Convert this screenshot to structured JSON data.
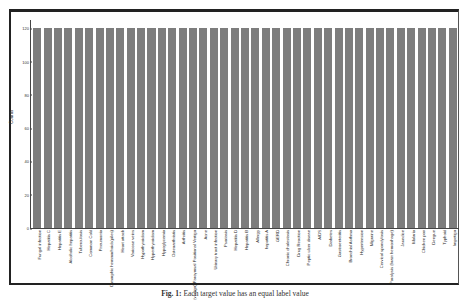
{
  "chart_data": {
    "type": "bar",
    "title": "",
    "xlabel": "",
    "ylabel": "Counts",
    "ylim": [
      0,
      125
    ],
    "yticks": [
      0,
      20,
      40,
      60,
      80,
      100,
      120
    ],
    "grid": false,
    "legend": null,
    "bar_color": "#7d7d7d",
    "categories": [
      "Fungal infection",
      "Hepatitis C",
      "Hepatitis E",
      "Alcoholic hepatitis",
      "Tuberculosis",
      "Common Cold",
      "Pneumonia",
      "Dimorphic hemmorhoids(piles)",
      "Heart attack",
      "Varicose veins",
      "Hypothyroidism",
      "Hyperthyroidism",
      "Hypoglycemia",
      "Osteoarthristis",
      "Arthritis",
      "(vertigo) Paroymsal Positional Vertigo",
      "Acne",
      "Urinary tract infection",
      "Psoriasis",
      "Hepatitis D",
      "Hepatitis B",
      "Allergy",
      "hepatitis A",
      "GERD",
      "Chronic cholestasis",
      "Drug Reaction",
      "Peptic ulcer diseae",
      "AIDS",
      "Diabetes",
      "Gastroenteritis",
      "Bronchial Asthma",
      "Hypertension",
      "Migraine",
      "Cervical spondylosis",
      "Paralysis (brain hemorrhage)",
      "Jaundice",
      "Malaria",
      "Chicken pox",
      "Dengue",
      "Typhoid",
      "Impetigo"
    ],
    "values": [
      120,
      120,
      120,
      120,
      120,
      120,
      120,
      120,
      120,
      120,
      120,
      120,
      120,
      120,
      120,
      120,
      120,
      120,
      120,
      120,
      120,
      120,
      120,
      120,
      120,
      120,
      120,
      120,
      120,
      120,
      120,
      120,
      120,
      120,
      120,
      120,
      120,
      120,
      120,
      120,
      120
    ]
  },
  "caption": {
    "label": "Fig. 1:",
    "text": "Each target value has an equal label value"
  }
}
